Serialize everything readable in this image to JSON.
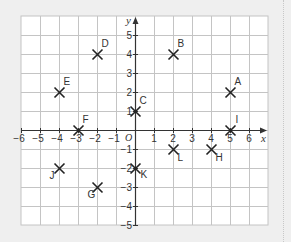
{
  "diagram": {
    "axes": {
      "x_label": "x",
      "y_label": "y",
      "origin_label": "O",
      "x_ticks": [
        -6,
        -5,
        -4,
        -3,
        -2,
        -1,
        1,
        2,
        3,
        4,
        5,
        6
      ],
      "y_ticks": [
        5,
        4,
        3,
        2,
        1,
        -1,
        -2,
        -3,
        -4,
        -5
      ],
      "x_tick_labels": [
        "−6",
        "−5",
        "−4",
        "−3",
        "−2",
        "−1",
        "1",
        "2",
        "3",
        "4",
        "5",
        "6"
      ],
      "y_tick_labels": [
        "5",
        "4",
        "3",
        "2",
        "1",
        "−1",
        "−2",
        "−3",
        "−4",
        "−5"
      ]
    },
    "grid": {
      "x_min": -6,
      "x_max": 7,
      "y_min": -5,
      "y_max": 6
    },
    "points": [
      {
        "label": "A",
        "x": 5,
        "y": 2,
        "lx": 4,
        "ly": -8
      },
      {
        "label": "B",
        "x": 2,
        "y": 4,
        "lx": 4,
        "ly": -8
      },
      {
        "label": "C",
        "x": 0,
        "y": 1,
        "lx": 4,
        "ly": -8
      },
      {
        "label": "D",
        "x": -2,
        "y": 4,
        "lx": 4,
        "ly": -8
      },
      {
        "label": "E",
        "x": -4,
        "y": 2,
        "lx": 4,
        "ly": -8
      },
      {
        "label": "F",
        "x": -3,
        "y": 0,
        "lx": 4,
        "ly": -8
      },
      {
        "label": "G",
        "x": -2,
        "y": -3,
        "lx": -10,
        "ly": 10
      },
      {
        "label": "H",
        "x": 4,
        "y": -1,
        "lx": 4,
        "ly": 11
      },
      {
        "label": "I",
        "x": 5,
        "y": 0,
        "lx": 5,
        "ly": -8
      },
      {
        "label": "J",
        "x": -4,
        "y": -2,
        "lx": -10,
        "ly": 10
      },
      {
        "label": "K",
        "x": 0,
        "y": -2,
        "lx": 5,
        "ly": 9
      },
      {
        "label": "L",
        "x": 2,
        "y": -1,
        "lx": 4,
        "ly": 11
      }
    ],
    "colors": {
      "background": "#efefef",
      "grid_fill": "#ffffff",
      "grid_line": "#c4c4c4",
      "axis": "#333333",
      "marker": "#222222",
      "text": "#333333"
    }
  }
}
